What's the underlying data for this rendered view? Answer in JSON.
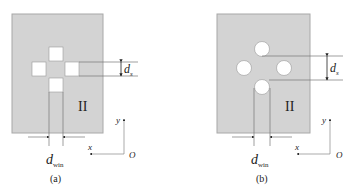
{
  "figure": {
    "colors": {
      "plate_fill": "#d3d3d3",
      "plate_stroke": "#a8a8a8",
      "hole_fill": "#ffffff",
      "line": "#666666",
      "text": "#222222"
    },
    "panels": [
      {
        "id": "a",
        "caption": "(a)",
        "hole_shape": "square",
        "region_label": "II",
        "dim_vertical_label": "d",
        "dim_vertical_sub": "s",
        "dim_horizontal_label": "d",
        "dim_horizontal_sub": "win",
        "axes": {
          "y_label": "y",
          "x_label": "x",
          "origin_label": "O"
        }
      },
      {
        "id": "b",
        "caption": "(b)",
        "hole_shape": "circle",
        "region_label": "II",
        "dim_vertical_label": "d",
        "dim_vertical_sub": "s",
        "dim_horizontal_label": "d",
        "dim_horizontal_sub": "win",
        "axes": {
          "y_label": "y",
          "x_label": "x",
          "origin_label": "O"
        }
      }
    ]
  }
}
